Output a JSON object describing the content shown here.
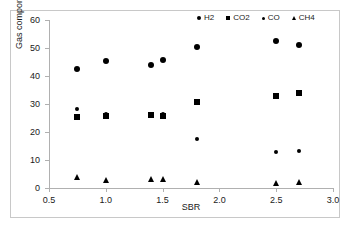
{
  "chart_data": {
    "type": "scatter",
    "title": "",
    "xlabel": "SBR",
    "ylabel": "Gas component [Mole %]",
    "xlim": [
      0.5,
      3.0
    ],
    "ylim": [
      0,
      60
    ],
    "xticks": [
      "0.5",
      "1.0",
      "1.5",
      "2.0",
      "2.5",
      "3.0"
    ],
    "xtick_values": [
      0.5,
      1.0,
      1.5,
      2.0,
      2.5,
      3.0
    ],
    "yticks": [
      "0",
      "10",
      "20",
      "30",
      "40",
      "50",
      "60"
    ],
    "ytick_values": [
      0,
      10,
      20,
      30,
      40,
      50,
      60
    ],
    "grid": false,
    "legend_position": "top-right",
    "series": [
      {
        "name": "H2",
        "marker": "circle",
        "color": "#000000",
        "points": [
          {
            "x": 0.75,
            "y": 42.5
          },
          {
            "x": 1.0,
            "y": 45.5
          },
          {
            "x": 1.4,
            "y": 43.9
          },
          {
            "x": 1.5,
            "y": 45.8
          },
          {
            "x": 1.8,
            "y": 50.2
          },
          {
            "x": 2.5,
            "y": 52.4
          },
          {
            "x": 2.7,
            "y": 51.2
          }
        ]
      },
      {
        "name": "CO2",
        "marker": "square",
        "color": "#000000",
        "points": [
          {
            "x": 0.75,
            "y": 25.5
          },
          {
            "x": 1.0,
            "y": 25.7
          },
          {
            "x": 1.4,
            "y": 26.2
          },
          {
            "x": 1.5,
            "y": 25.7
          },
          {
            "x": 1.8,
            "y": 30.8
          },
          {
            "x": 2.5,
            "y": 32.8
          },
          {
            "x": 2.7,
            "y": 33.9
          }
        ]
      },
      {
        "name": "CO",
        "marker": "small-circle",
        "color": "#000000",
        "points": [
          {
            "x": 0.75,
            "y": 28.3
          },
          {
            "x": 1.0,
            "y": 26.6
          },
          {
            "x": 1.4,
            "y": 26.6
          },
          {
            "x": 1.5,
            "y": 26.3
          },
          {
            "x": 1.8,
            "y": 17.4
          },
          {
            "x": 2.5,
            "y": 13.0
          },
          {
            "x": 2.7,
            "y": 13.3
          }
        ]
      },
      {
        "name": "CH4",
        "marker": "triangle",
        "color": "#000000",
        "points": [
          {
            "x": 0.75,
            "y": 3.8
          },
          {
            "x": 1.0,
            "y": 3.0
          },
          {
            "x": 1.4,
            "y": 3.2
          },
          {
            "x": 1.5,
            "y": 3.2
          },
          {
            "x": 1.8,
            "y": 2.0
          },
          {
            "x": 2.5,
            "y": 1.9
          },
          {
            "x": 2.7,
            "y": 2.1
          }
        ]
      }
    ]
  }
}
